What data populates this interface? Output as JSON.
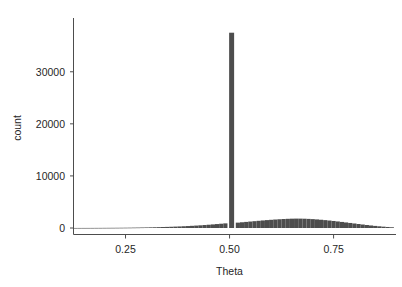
{
  "chart_data": {
    "type": "bar",
    "title": "",
    "subtitle": "",
    "xlabel": "Theta",
    "ylabel": "count",
    "grid": false,
    "legend": null,
    "xlim": [
      0.125,
      0.9
    ],
    "ylim": [
      0,
      38500
    ],
    "xticks": [
      0.25,
      0.5,
      0.75
    ],
    "xtick_labels": [
      "0.25",
      "0.50",
      "0.75"
    ],
    "yticks": [
      0,
      10000,
      20000,
      30000
    ],
    "ytick_labels": [
      "0",
      "10000",
      "20000",
      "30000"
    ],
    "bar_color": "#4d4d4d",
    "axis_color": "#4d4d4d",
    "text_color": "#262626",
    "background_color": "#ffffff",
    "bin_width": 0.01,
    "x": [
      0.13,
      0.14,
      0.15,
      0.16,
      0.17,
      0.18,
      0.19,
      0.2,
      0.21,
      0.22,
      0.23,
      0.24,
      0.25,
      0.26,
      0.27,
      0.28,
      0.29,
      0.3,
      0.31,
      0.32,
      0.33,
      0.34,
      0.35,
      0.36,
      0.37,
      0.38,
      0.39,
      0.4,
      0.41,
      0.42,
      0.43,
      0.44,
      0.45,
      0.46,
      0.47,
      0.48,
      0.49,
      0.505,
      0.52,
      0.53,
      0.54,
      0.55,
      0.56,
      0.57,
      0.58,
      0.59,
      0.6,
      0.61,
      0.62,
      0.63,
      0.64,
      0.65,
      0.66,
      0.67,
      0.68,
      0.69,
      0.7,
      0.71,
      0.72,
      0.73,
      0.74,
      0.75,
      0.76,
      0.77,
      0.78,
      0.79,
      0.8,
      0.81,
      0.82,
      0.83,
      0.84,
      0.85,
      0.86,
      0.87,
      0.88,
      0.89
    ],
    "values": [
      10,
      12,
      14,
      16,
      18,
      21,
      24,
      28,
      32,
      36,
      42,
      48,
      55,
      64,
      74,
      85,
      98,
      112,
      128,
      146,
      166,
      188,
      212,
      238,
      268,
      300,
      336,
      375,
      418,
      465,
      515,
      570,
      628,
      690,
      755,
      822,
      890,
      37500,
      1030,
      1100,
      1170,
      1240,
      1310,
      1380,
      1450,
      1515,
      1575,
      1630,
      1680,
      1725,
      1765,
      1792,
      1805,
      1800,
      1782,
      1750,
      1705,
      1650,
      1585,
      1512,
      1432,
      1348,
      1258,
      1165,
      1068,
      968,
      868,
      768,
      670,
      575,
      486,
      402,
      325,
      256,
      196,
      145
    ],
    "spike": {
      "x": 0.505,
      "value": 37500,
      "width": 0.012
    },
    "hump": {
      "center": 0.66,
      "peak_value": 1805,
      "left_edge": 0.13,
      "right_edge": 0.895
    }
  },
  "axes": {
    "ylabel_text": "count",
    "xlabel_text": "Theta"
  }
}
